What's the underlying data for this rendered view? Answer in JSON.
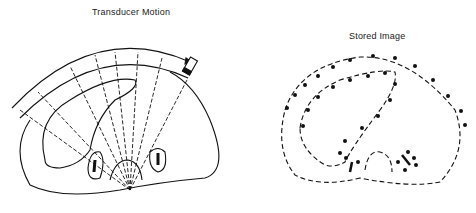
{
  "figure": {
    "left_panel": {
      "title": "Transducer Motion",
      "elements": [
        "scan-arc",
        "transducer-positions",
        "ultrasound-beams",
        "body-outline",
        "organ-outline",
        "kidney-left",
        "kidney-right",
        "spine"
      ]
    },
    "right_panel": {
      "title": "Stored Image",
      "elements": [
        "dotted-body-outline",
        "dotted-organ-outline",
        "stored-echo-points",
        "stored-kidneys"
      ]
    }
  },
  "colors": {
    "ink": "#111111",
    "background": "#ffffff"
  }
}
